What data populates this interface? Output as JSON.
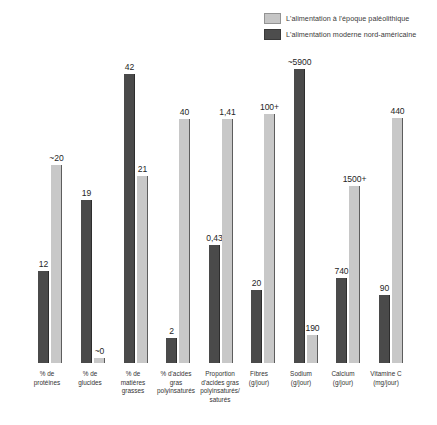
{
  "chart_data": {
    "type": "bar",
    "title": "",
    "xlabel": "",
    "ylabel": "",
    "grid": false,
    "legend_position": "top-right",
    "note": "Grouped bar chart; each category pair is scaled independently (no common y-axis).",
    "categories": [
      "% de protéines",
      "% de glucides",
      "% de matières grasses",
      "% d'acides gras polyinsaturés",
      "Proportion d'acides gras polyinsaturés/ saturés",
      "Fibres (g/jour)",
      "Sodium (g/jour)",
      "Calcium (g/jour)",
      "Vitamine C (mg/jour)"
    ],
    "series": [
      {
        "name": "L'alimentation moderne nord-américaine",
        "color": "#4a4a4a",
        "values": [
          12,
          19,
          42,
          2,
          0.43,
          20,
          5900,
          740,
          90
        ],
        "labels": [
          "12",
          "19",
          "42",
          "2",
          "0,43",
          "20",
          "~5900",
          "740",
          "90"
        ]
      },
      {
        "name": "L'alimentation à l'époque paléolithique",
        "color": "#c8c8c8",
        "values": [
          20,
          0,
          21,
          40,
          1.41,
          100,
          190,
          1500,
          440
        ],
        "labels": [
          "~20",
          "~0",
          "21",
          "40",
          "1,41",
          "100+",
          "190",
          "1500+",
          "440"
        ]
      }
    ]
  },
  "legend": {
    "items": [
      {
        "label": "L'alimentation à l'époque paléolithique",
        "swatch": "light"
      },
      {
        "label": "L'alimentation moderne nord-américaine",
        "swatch": "dark"
      }
    ]
  },
  "xaxis": {
    "labels": [
      "% de\nprotéines",
      "% de\nglucides",
      "% de\nmatières\ngrasses",
      "% d'acides\ngras\npolyinsaturés",
      "Proportion\nd'acides gras\npolyinsaturés/\nsaturés",
      "Fibres\n(g/jour)",
      "Sodium\n(g/jour)",
      "Calcium\n(g/jour)",
      "Vitamine C\n(mg/jour)"
    ]
  },
  "bars": [
    {
      "group": 0,
      "series": 0,
      "label": "12",
      "height_px": 92,
      "x": 38,
      "kind": "dark"
    },
    {
      "group": 0,
      "series": 1,
      "label": "~20",
      "height_px": 198,
      "x": 51,
      "kind": "light"
    },
    {
      "group": 1,
      "series": 0,
      "label": "19",
      "height_px": 163,
      "x": 81,
      "kind": "dark"
    },
    {
      "group": 1,
      "series": 1,
      "label": "~0",
      "height_px": 5,
      "x": 94,
      "kind": "light"
    },
    {
      "group": 2,
      "series": 0,
      "label": "42",
      "height_px": 289,
      "x": 124,
      "kind": "dark"
    },
    {
      "group": 2,
      "series": 1,
      "label": "21",
      "height_px": 187,
      "x": 137,
      "kind": "light"
    },
    {
      "group": 3,
      "series": 0,
      "label": "2",
      "height_px": 25,
      "x": 166,
      "kind": "dark"
    },
    {
      "group": 3,
      "series": 1,
      "label": "40",
      "height_px": 244,
      "x": 179,
      "kind": "light"
    },
    {
      "group": 4,
      "series": 0,
      "label": "0,43",
      "height_px": 118,
      "x": 209,
      "kind": "dark"
    },
    {
      "group": 4,
      "series": 1,
      "label": "1,41",
      "height_px": 244,
      "x": 222,
      "kind": "light"
    },
    {
      "group": 5,
      "series": 0,
      "label": "20",
      "height_px": 73,
      "x": 251,
      "kind": "dark"
    },
    {
      "group": 5,
      "series": 1,
      "label": "100+",
      "height_px": 249,
      "x": 264,
      "kind": "light"
    },
    {
      "group": 6,
      "series": 0,
      "label": "~5900",
      "height_px": 294,
      "x": 294,
      "kind": "dark"
    },
    {
      "group": 6,
      "series": 1,
      "label": "190",
      "height_px": 28,
      "x": 307,
      "kind": "light"
    },
    {
      "group": 7,
      "series": 0,
      "label": "740",
      "height_px": 85,
      "x": 336,
      "kind": "dark"
    },
    {
      "group": 7,
      "series": 1,
      "label": "1500+",
      "height_px": 177,
      "x": 349,
      "kind": "light"
    },
    {
      "group": 8,
      "series": 0,
      "label": "90",
      "height_px": 68,
      "x": 379,
      "kind": "dark"
    },
    {
      "group": 8,
      "series": 1,
      "label": "440",
      "height_px": 245,
      "x": 392,
      "kind": "light"
    }
  ],
  "xlabel_positions": [
    {
      "x": 18,
      "w": 58
    },
    {
      "x": 61,
      "w": 58
    },
    {
      "x": 104,
      "w": 58
    },
    {
      "x": 143,
      "w": 66
    },
    {
      "x": 185,
      "w": 70
    },
    {
      "x": 230,
      "w": 58
    },
    {
      "x": 272,
      "w": 58
    },
    {
      "x": 314,
      "w": 58
    },
    {
      "x": 355,
      "w": 62
    }
  ],
  "colors": {
    "background": "#ffffff",
    "light_bar": "#c8c8c8",
    "dark_bar": "#4a4a4a",
    "text": "#2b2b2b"
  }
}
